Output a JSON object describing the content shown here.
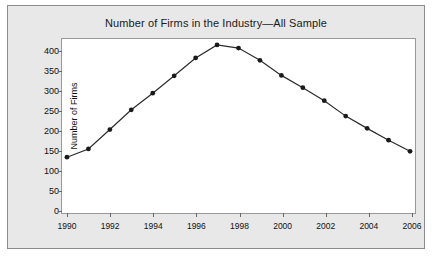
{
  "chart_data": {
    "type": "line",
    "title": "Number of Firms in the Industry—All Sample",
    "xlabel": "",
    "ylabel": "Number of Firms",
    "x": [
      1990,
      1991,
      1992,
      1993,
      1994,
      1995,
      1996,
      1997,
      1998,
      1999,
      2000,
      2001,
      2002,
      2003,
      2004,
      2005,
      2006
    ],
    "values": [
      131,
      152,
      201,
      251,
      293,
      337,
      382,
      415,
      407,
      376,
      338,
      307,
      274,
      235,
      204,
      174,
      146
    ],
    "series": [
      {
        "name": "All Sample",
        "values": [
          131,
          152,
          201,
          251,
          293,
          337,
          382,
          415,
          407,
          376,
          338,
          307,
          274,
          235,
          204,
          174,
          146
        ]
      }
    ],
    "xlim": [
      1990,
      2006
    ],
    "ylim": [
      0,
      420
    ],
    "ytick_labels": [
      "400",
      "350",
      "300",
      "250",
      "200",
      "150",
      "100",
      "50",
      "0"
    ],
    "ytick_values": [
      400,
      350,
      300,
      250,
      200,
      150,
      100,
      50,
      0
    ],
    "xtick_labels": [
      "1990",
      "1992",
      "1994",
      "1996",
      "1998",
      "2000",
      "2002",
      "2004",
      "2006"
    ],
    "xtick_values": [
      1990,
      1992,
      1994,
      1996,
      1998,
      2000,
      2002,
      2004,
      2006
    ],
    "grid": false,
    "legend": false,
    "marker": "filled-circle",
    "line_color": "#2b2b2b",
    "marker_color": "#1a1a1a",
    "plot_background": "#ffffff",
    "figure_background": "#e8e8e8"
  }
}
